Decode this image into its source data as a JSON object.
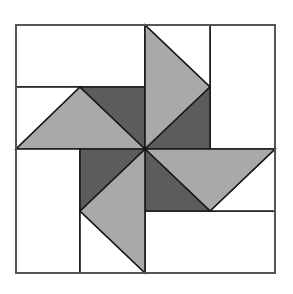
{
  "diagram": {
    "colors": {
      "background": "#ffffff",
      "light": "#a9a9a9",
      "dark": "#5c5c5c",
      "white": "#ffffff",
      "line": "#1a1a1a",
      "border": "#555555"
    },
    "outer": {
      "x1": 16,
      "y1": 25,
      "x2": 275,
      "y2": 273
    },
    "center": {
      "x": 145,
      "y": 149
    },
    "shapes": [
      {
        "name": "top-left-white-rect",
        "fill": "white",
        "points": [
          [
            16,
            25
          ],
          [
            145,
            25
          ],
          [
            145,
            87
          ],
          [
            16,
            87
          ]
        ]
      },
      {
        "name": "top-left-white-triangle",
        "fill": "white",
        "points": [
          [
            16,
            87
          ],
          [
            80,
            87
          ],
          [
            16,
            149
          ]
        ]
      },
      {
        "name": "top-left-light-triangle",
        "fill": "light",
        "points": [
          [
            16,
            149
          ],
          [
            80,
            87
          ],
          [
            145,
            149
          ]
        ]
      },
      {
        "name": "top-left-dark-triangle",
        "fill": "dark",
        "points": [
          [
            80,
            87
          ],
          [
            145,
            87
          ],
          [
            145,
            149
          ]
        ]
      },
      {
        "name": "top-right-white-rect",
        "fill": "white",
        "points": [
          [
            210,
            25
          ],
          [
            275,
            25
          ],
          [
            275,
            149
          ],
          [
            210,
            149
          ]
        ]
      },
      {
        "name": "top-right-white-triangle",
        "fill": "white",
        "points": [
          [
            145,
            25
          ],
          [
            210,
            25
          ],
          [
            210,
            87
          ]
        ]
      },
      {
        "name": "top-right-light-triangle",
        "fill": "light",
        "points": [
          [
            145,
            25
          ],
          [
            210,
            87
          ],
          [
            145,
            149
          ]
        ]
      },
      {
        "name": "top-right-dark-triangle",
        "fill": "dark",
        "points": [
          [
            145,
            149
          ],
          [
            210,
            87
          ],
          [
            210,
            149
          ]
        ]
      },
      {
        "name": "bottom-right-white-rect",
        "fill": "white",
        "points": [
          [
            145,
            211
          ],
          [
            275,
            211
          ],
          [
            275,
            273
          ],
          [
            145,
            273
          ]
        ]
      },
      {
        "name": "bottom-right-white-triangle",
        "fill": "white",
        "points": [
          [
            275,
            149
          ],
          [
            275,
            211
          ],
          [
            210,
            211
          ]
        ]
      },
      {
        "name": "bottom-right-light-triangle",
        "fill": "light",
        "points": [
          [
            145,
            149
          ],
          [
            275,
            149
          ],
          [
            210,
            211
          ]
        ]
      },
      {
        "name": "bottom-right-dark-triangle",
        "fill": "dark",
        "points": [
          [
            145,
            149
          ],
          [
            210,
            211
          ],
          [
            145,
            211
          ]
        ]
      },
      {
        "name": "bottom-left-white-rect",
        "fill": "white",
        "points": [
          [
            16,
            149
          ],
          [
            80,
            149
          ],
          [
            80,
            273
          ],
          [
            16,
            273
          ]
        ]
      },
      {
        "name": "bottom-left-white-triangle",
        "fill": "white",
        "points": [
          [
            80,
            211
          ],
          [
            145,
            273
          ],
          [
            80,
            273
          ]
        ]
      },
      {
        "name": "bottom-left-light-triangle",
        "fill": "light",
        "points": [
          [
            145,
            149
          ],
          [
            145,
            273
          ],
          [
            80,
            211
          ]
        ]
      },
      {
        "name": "bottom-left-dark-triangle",
        "fill": "dark",
        "points": [
          [
            80,
            149
          ],
          [
            145,
            149
          ],
          [
            80,
            211
          ]
        ]
      }
    ]
  }
}
